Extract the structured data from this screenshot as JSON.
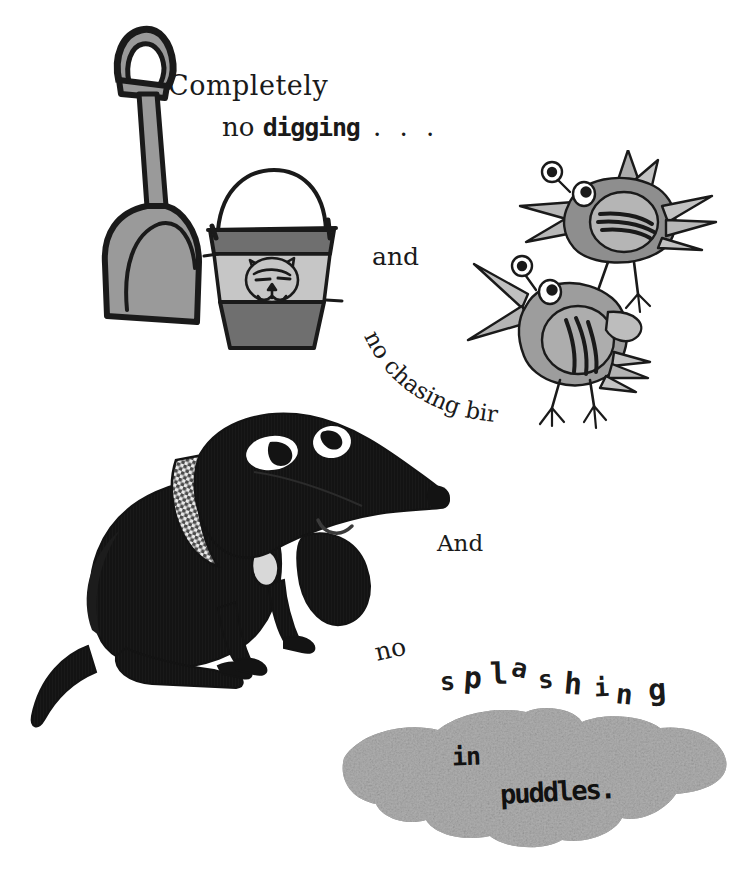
{
  "page": {
    "background_color": "#ffffff",
    "ink_color": "#1a1a1a"
  },
  "text": {
    "line1": "Completely",
    "line2_word_no": "no ",
    "line2_word_digging": "digging",
    "line2_dots": " . . .",
    "and": "and",
    "arc_line": "no chasing birds.",
    "And": "And",
    "no2": "no",
    "splashing_letters": [
      "s",
      "p",
      "l",
      "a",
      "s",
      "h",
      "i",
      "n",
      "g"
    ],
    "in": "in",
    "puddles": "puddles."
  },
  "illustrations": {
    "shovel": {
      "name": "shovel",
      "handle_color": "#9a9a9a",
      "blade_color": "#9a9a9a",
      "outline_color": "#1a1a1a"
    },
    "bucket": {
      "name": "bucket-with-cat-face",
      "band_dark_color": "#6f6f6f",
      "band_light_color": "#c6c6c6",
      "outline_color": "#1a1a1a",
      "motif": "cat-face"
    },
    "bird_top": {
      "name": "bird-flying-upper",
      "body_color": "#8e8e8e",
      "belly_color": "#b5b5b5",
      "outline_color": "#1a1a1a"
    },
    "bird_bottom": {
      "name": "bird-standing-lower",
      "body_color": "#9d9d9d",
      "belly_color": "#adadad",
      "outline_color": "#1a1a1a"
    },
    "dog": {
      "name": "black-dachshund-sitting",
      "body_color": "#131313",
      "eye_color": "#ffffff",
      "collar_pattern": "checkered",
      "tag_color": "#d8d8d8"
    },
    "puddle": {
      "name": "grey-puddle",
      "fill_color": "#9a9a9a",
      "texture": "mottled-grey"
    }
  }
}
